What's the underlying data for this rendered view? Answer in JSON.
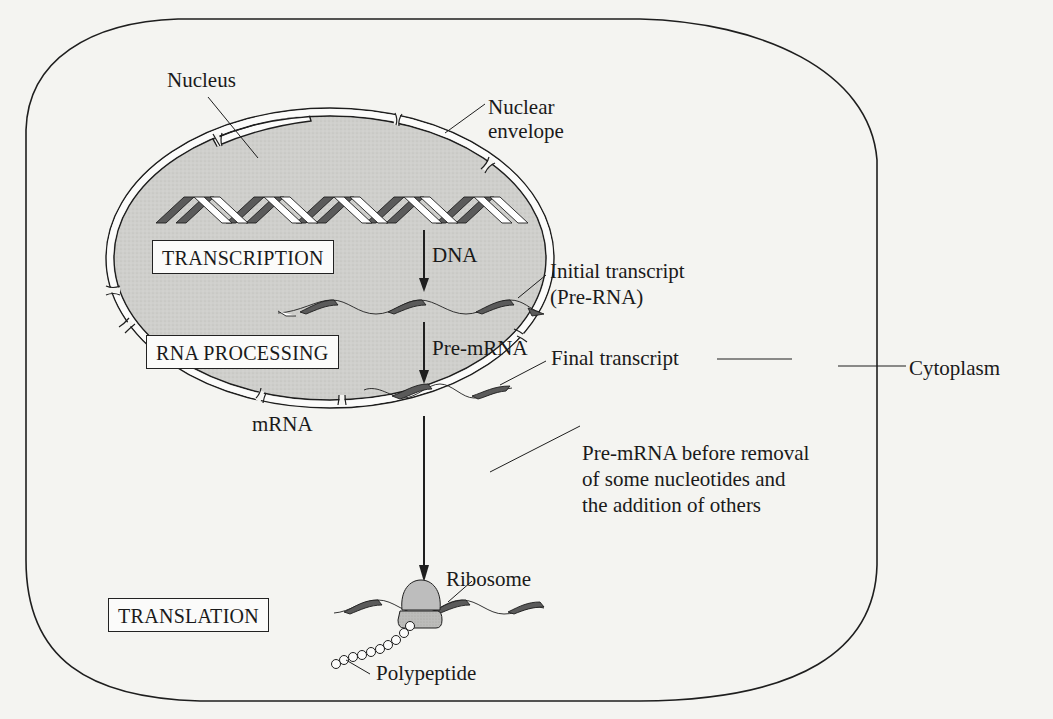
{
  "diagram": {
    "colors": {
      "background": "#f4f4f1",
      "nucleus_fill": "#cfcfcc",
      "outline": "#1e1e1e",
      "ribbon_dark": "#5a5a5a",
      "ribbon_light": "#ffffff",
      "ribosome": "#bdbdbd"
    },
    "compartments": {
      "cell": "Cytoplasm",
      "nucleus": "Nucleus",
      "envelope_line1": "Nuclear",
      "envelope_line2": "envelope"
    },
    "stages": [
      {
        "id": "transcription",
        "label": "TRANSCRIPTION"
      },
      {
        "id": "rna-processing",
        "label": "RNA PROCESSING"
      },
      {
        "id": "translation",
        "label": "TRANSLATION"
      }
    ],
    "flow_labels": {
      "dna": "DNA",
      "pre_mrna": "Pre-mRNA",
      "mrna": "mRNA"
    },
    "callouts": {
      "initial_transcript_line1": "Initial transcript",
      "initial_transcript_line2": "(Pre-RNA)",
      "final_transcript": "Final transcript",
      "premrna_note_line1": "Pre-mRNA before removal",
      "premrna_note_line2": "of some nucleotides and",
      "premrna_note_line3": "the addition of others",
      "ribosome": "Ribosome",
      "polypeptide": "Polypeptide"
    }
  }
}
